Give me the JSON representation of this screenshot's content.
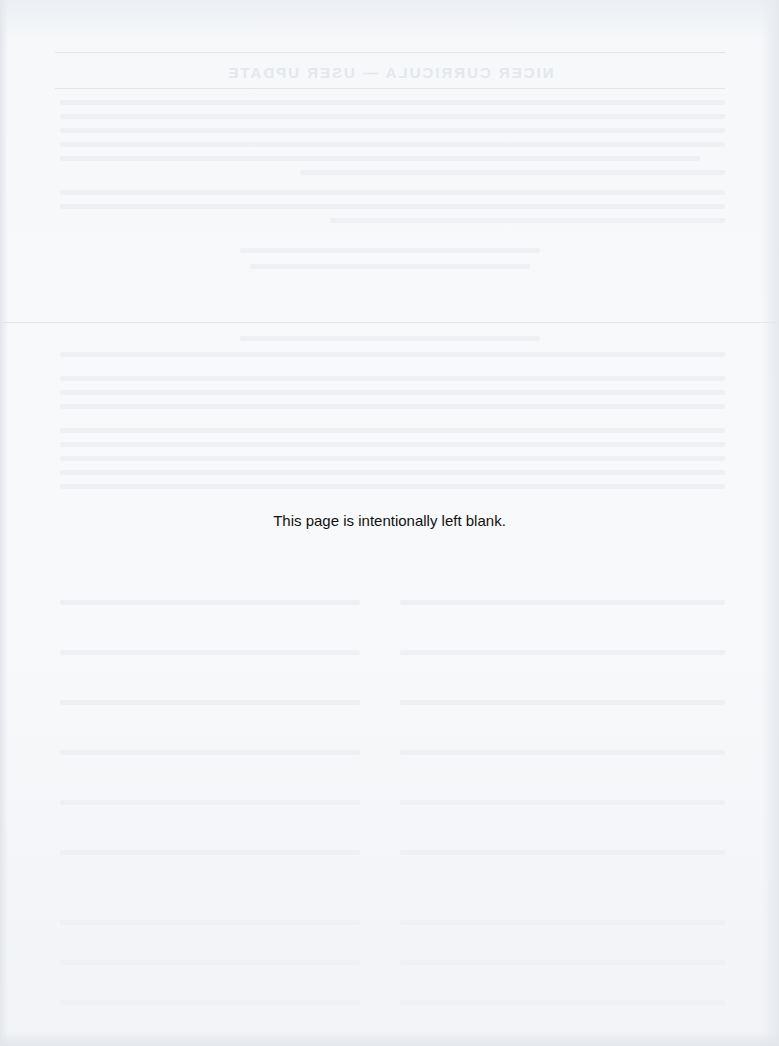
{
  "page": {
    "notice": "This page is intentionally left blank.",
    "background_color": "#f6f8fa",
    "text_color": "#111111"
  },
  "showthrough": {
    "title_mirrored": "NICER CURRICULA — USER UPDATE"
  }
}
